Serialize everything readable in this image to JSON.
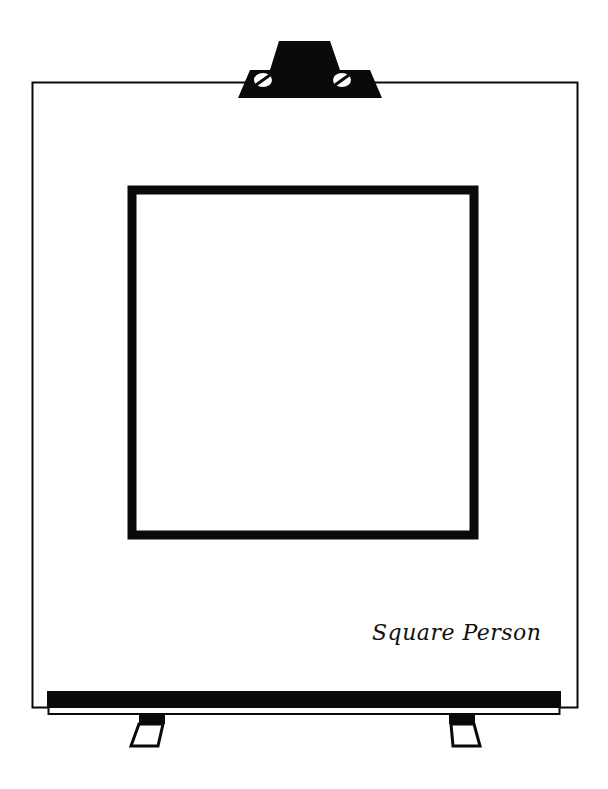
{
  "easel": {
    "caption": "Square Person",
    "colors": {
      "ink": "#0a0a0a",
      "paper": "#ffffff"
    },
    "icons": {
      "clip": "easel-clip-icon",
      "screw": "screw-icon",
      "leg": "easel-leg-icon"
    }
  }
}
